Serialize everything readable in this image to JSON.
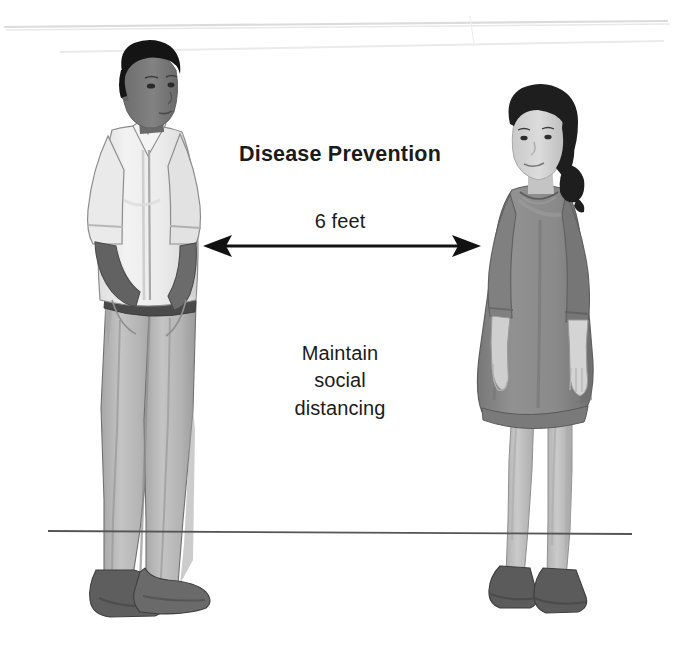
{
  "illustration": {
    "title": "Disease Prevention",
    "distance_label": "6 feet",
    "instruction": "Maintain\nsocial\ndistancing",
    "background_color": "#ffffff",
    "text_color": "#1b1b1b",
    "ground_line_color": "#555555",
    "wall_line_color": "#d8d8d8",
    "arrow": {
      "name": "double-headed-measurement-arrow",
      "color": "#111111",
      "from_x": 203,
      "to_x": 481,
      "y": 246
    },
    "figures": [
      {
        "id": "man",
        "label": "Standing man with hands in pockets",
        "hair_color": "#141414",
        "skin_color": "#7d7d7d",
        "skin_shadow_color": "#626262",
        "shirt_color": "#eeeeee",
        "shirt_shadow_color": "#d2d2d2",
        "belt_color": "#4a4a4a",
        "trousers_color": "#b9b9b9",
        "trousers_shadow_color": "#9c9c9c",
        "shoe_color": "#5e5e5e",
        "shoe_shadow_color": "#474747",
        "outline_color": "#6b6b6b"
      },
      {
        "id": "woman",
        "label": "Standing woman in a gray dress",
        "hair_color": "#1e1e1e",
        "skin_color": "#d6d6d6",
        "skin_shadow_color": "#b4b4b4",
        "dress_color": "#8a8a8a",
        "dress_shadow_color": "#6f6f6f",
        "leg_color": "#c2c2c2",
        "leg_shadow_color": "#a7a7a7",
        "shoe_color": "#5b5b5b",
        "shoe_shadow_color": "#444444",
        "outline_color": "#6b6b6b"
      }
    ]
  }
}
